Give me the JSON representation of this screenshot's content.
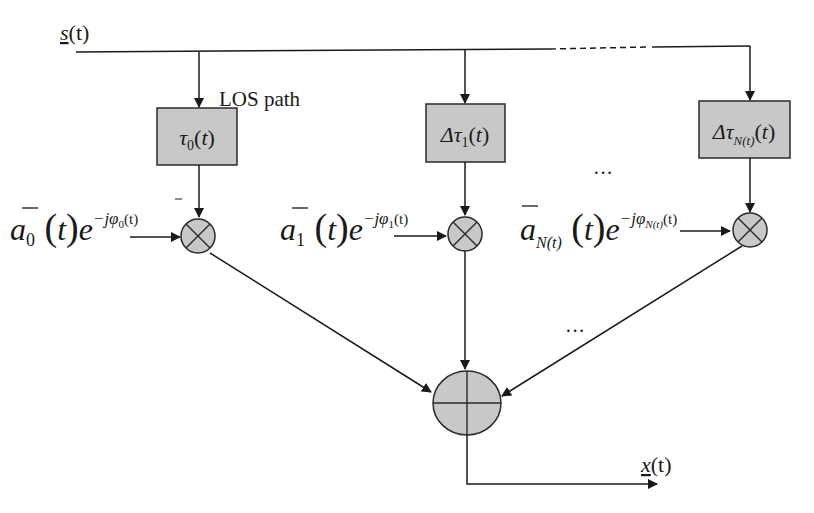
{
  "diagram": {
    "type": "multipath channel block diagram",
    "input_signal": {
      "base": "s",
      "arg": "(t)",
      "underlined": true
    },
    "output_signal": {
      "base": "x",
      "arg": "(t)",
      "underlined": true
    },
    "los_label": "LOS path",
    "ellipsis": "···",
    "paths": [
      {
        "delay_prefix": "",
        "delay_symbol": "τ",
        "delay_sub": "0",
        "delay_arg": "(t)",
        "gain_symbol": "a",
        "gain_sub": "0",
        "gain_arg": "(t)",
        "exp_base": "e",
        "exp_power": "−jφ",
        "exp_sub": "0",
        "exp_arg": "(t)"
      },
      {
        "delay_prefix": "Δ",
        "delay_symbol": "τ",
        "delay_sub": "1",
        "delay_arg": "(t)",
        "gain_symbol": "a",
        "gain_sub": "1",
        "gain_arg": "(t)",
        "exp_base": "e",
        "exp_power": "−jφ",
        "exp_sub": "1",
        "exp_arg": "(t)"
      },
      {
        "delay_prefix": "Δ",
        "delay_symbol": "τ",
        "delay_sub": "N(t)",
        "delay_arg": "(t)",
        "gain_symbol": "a",
        "gain_sub": "N(t)",
        "gain_arg": "(t)",
        "exp_base": "e",
        "exp_power": "−jφ",
        "exp_sub": "N(t)",
        "exp_arg": "(t)"
      }
    ],
    "multiplier_icon": "circle-times",
    "summer_icon": "circle-plus",
    "colors": {
      "block_fill": "#c8c8c8",
      "stroke": "#1a1a1a",
      "background": "#ffffff"
    }
  }
}
